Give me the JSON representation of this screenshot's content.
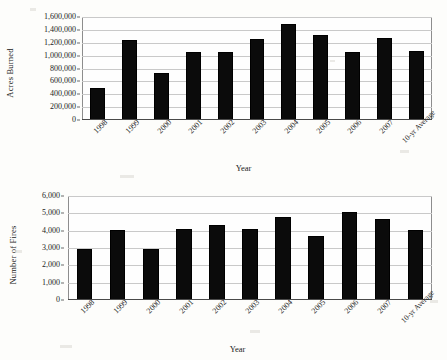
{
  "chart_data": [
    {
      "id": "acres-burned",
      "type": "bar",
      "title": "",
      "xlabel": "Year",
      "ylabel": "Acres Burned",
      "categories": [
        "1998",
        "1999",
        "2000",
        "2001",
        "2002",
        "2003",
        "2004",
        "2005",
        "2006",
        "2007",
        "10-yr Average"
      ],
      "values": [
        505000,
        1240000,
        725000,
        1060000,
        1050000,
        1260000,
        1490000,
        1320000,
        1055000,
        1270000,
        1075000
      ],
      "ylim": [
        0,
        1600000
      ],
      "ytick_values": [
        0,
        200000,
        400000,
        600000,
        800000,
        1000000,
        1200000,
        1400000,
        1600000
      ],
      "yticks": [
        "0",
        "200,000",
        "400,000",
        "600,000",
        "800,000",
        "1,000,000",
        "1,200,000",
        "1,400,000",
        "1,600,000"
      ],
      "grid": true,
      "legend": "none",
      "bar_color": "#0b0b0b"
    },
    {
      "id": "number-of-fires",
      "type": "bar",
      "title": "",
      "xlabel": "Year",
      "ylabel": "Number of Fires",
      "categories": [
        "1998",
        "1999",
        "2000",
        "2001",
        "2002",
        "2003",
        "2004",
        "2005",
        "2006",
        "2007",
        "10-yr Average"
      ],
      "values": [
        2950,
        4050,
        2920,
        4080,
        4300,
        4100,
        4800,
        3700,
        5050,
        4700,
        4050
      ],
      "ylim": [
        0,
        6000
      ],
      "ytick_values": [
        0,
        1000,
        2000,
        3000,
        4000,
        5000,
        6000
      ],
      "yticks": [
        "0",
        "1,000",
        "2,000",
        "3,000",
        "4,000",
        "5,000",
        "6,000"
      ],
      "grid": true,
      "legend": "none",
      "bar_color": "#0b0b0b"
    }
  ],
  "page": {
    "background": "#fdfdfb",
    "axis_color": "#4a4a4a",
    "grid_color": "#c9c9c9"
  }
}
